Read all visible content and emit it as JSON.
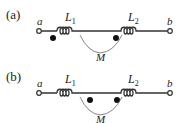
{
  "diagram": {
    "type": "coupled-inductors",
    "panels": [
      {
        "id": "a",
        "label": "(a)",
        "terminal_left": "a",
        "terminal_right": "b",
        "inductor_1": {
          "name": "L",
          "sub": "1"
        },
        "inductor_2": {
          "name": "L",
          "sub": "2"
        },
        "mutual": "M",
        "dots": "left side of L1 and left side of L2 (below wire)"
      },
      {
        "id": "b",
        "label": "(b)",
        "terminal_left": "a",
        "terminal_right": "b",
        "inductor_1": {
          "name": "L",
          "sub": "1"
        },
        "inductor_2": {
          "name": "L",
          "sub": "2"
        },
        "mutual": "M",
        "dots": "right side of L1 and left side of L2 (below wire)"
      }
    ]
  }
}
